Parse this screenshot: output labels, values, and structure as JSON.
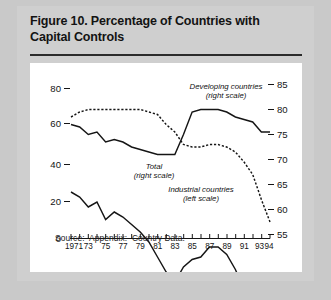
{
  "figure": {
    "title": "Figure 10.  Percentage of Countries with Capital Controls",
    "title_line1": "Figure 10.  Percentage of Countries with",
    "title_line2": "Capital Controls",
    "source": "Source:  Appendix:  Country Data."
  },
  "chart_data": {
    "type": "line",
    "title": "Figure 10. Percentage of Countries with Capital Controls",
    "xlabel": "",
    "ylabel": "",
    "grid": false,
    "legend": "annotations-on-plot",
    "xlim": [
      1971,
      1994
    ],
    "left_axis": {
      "name": "left scale",
      "ticks": [
        "0",
        "20",
        "40",
        "60",
        "80"
      ],
      "tick_values": [
        0,
        20,
        40,
        60,
        80
      ],
      "ylim": [
        0,
        88
      ]
    },
    "right_axis": {
      "name": "right scale",
      "ticks": [
        "55",
        "60",
        "65",
        "70",
        "75",
        "80",
        "85"
      ],
      "tick_values": [
        55,
        60,
        65,
        70,
        75,
        80,
        85
      ],
      "ylim": [
        53.5,
        87
      ]
    },
    "x": [
      1971,
      1972,
      1973,
      1974,
      1975,
      1976,
      1977,
      1978,
      1979,
      1980,
      1981,
      1982,
      1983,
      1984,
      1985,
      1986,
      1987,
      1988,
      1989,
      1990,
      1991,
      1992,
      1993,
      1994
    ],
    "xticks": [
      1971,
      1973,
      1975,
      1977,
      1979,
      1981,
      1983,
      1985,
      1987,
      1989,
      1991,
      1993,
      1994
    ],
    "xtick_labels": [
      "1971",
      "73",
      "75",
      "77",
      "79",
      "81",
      "83",
      "85",
      "87",
      "89",
      "91",
      "93",
      "94"
    ],
    "series": [
      {
        "name": "Developing countries",
        "scale": "right",
        "style": "dashed",
        "annotation": "Developing countries\n(right scale)",
        "annotation_line1": "Developing countries",
        "annotation_line2": "(right scale)",
        "values": [
          78.5,
          79.5,
          80.0,
          80.0,
          80.0,
          80.0,
          80.0,
          80.0,
          80.0,
          79.5,
          79.0,
          77.0,
          75.5,
          73.0,
          72.5,
          72.5,
          73.0,
          73.0,
          72.5,
          71.5,
          69.5,
          67.0,
          62.0,
          57.5
        ]
      },
      {
        "name": "Total",
        "scale": "right",
        "style": "solid",
        "annotation": "Total\n(right scale)",
        "annotation_line1": "Total",
        "annotation_line2": "(right scale)",
        "values": [
          77.0,
          76.5,
          75.0,
          75.5,
          73.5,
          74.0,
          73.5,
          72.5,
          72.0,
          71.5,
          71.0,
          71.0,
          71.0,
          75.0,
          79.5,
          80.0,
          80.0,
          80.0,
          79.5,
          78.5,
          78.0,
          77.5,
          75.5,
          75.5
        ]
      },
      {
        "name": "Industrial countries",
        "scale": "left",
        "style": "solid",
        "annotation": "Industrial countries\n(left scale)",
        "annotation_line1": "Industrial countries",
        "annotation_line2": "(left scale)",
        "values": [
          63.5,
          62.5,
          60.5,
          61.5,
          58.0,
          59.5,
          58.5,
          57.0,
          55.5,
          53.5,
          50.5,
          47.5,
          45.5,
          48.5,
          50.0,
          50.5,
          52.5,
          52.5,
          51.0,
          48.0,
          44.0,
          42.0,
          35.5,
          34.5
        ]
      }
    ]
  }
}
